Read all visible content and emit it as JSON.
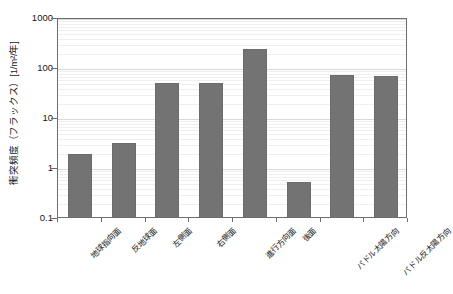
{
  "chart_data": {
    "type": "bar",
    "title": "",
    "subtitle": "",
    "xlabel": "",
    "ylabel": "衝突頻度（フラックス）[1/m²/年]",
    "yscale": "log",
    "ylim": [
      0.1,
      1000
    ],
    "ytick_labels": [
      "1000",
      "100",
      "10",
      "1",
      "0.1"
    ],
    "ytick_values": [
      1000,
      100,
      10,
      1,
      0.1
    ],
    "grid": true,
    "legend": null,
    "categories": [
      "地球指向面",
      "反地球面",
      "左側面",
      "右側面",
      "進行方向面",
      "後面",
      "パドル太陽方向",
      "パドル反太陽方向"
    ],
    "values": [
      2.0,
      3.3,
      52,
      52,
      250,
      0.55,
      77,
      72
    ],
    "bar_color": "#737373"
  },
  "axis": {
    "frame_color": "#6e6e6e",
    "gridline_color": "#d9d9d9",
    "minor_gridline_color": "#efefef"
  }
}
